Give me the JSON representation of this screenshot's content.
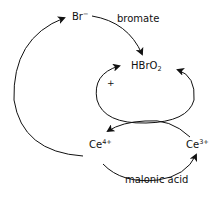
{
  "diagram": {
    "title": "",
    "nodes": {
      "bromide": {
        "base": "Br",
        "charge": "−"
      },
      "hbro2": {
        "base": "HBrO",
        "subscript": "2"
      },
      "ce4": {
        "base": "Ce",
        "charge": "4+"
      },
      "ce3": {
        "base": "Ce",
        "charge": "3+"
      }
    },
    "edge_labels": {
      "bromate": "bromate",
      "malonic_acid": "malonic acid",
      "autocatalysis": "+"
    },
    "edges": [
      {
        "from": "Br−",
        "to": "HBrO2",
        "label": "bromate"
      },
      {
        "from": "HBrO2",
        "to": "HBrO2",
        "label": "+",
        "type": "autocatalytic loop"
      },
      {
        "from": "Ce3+",
        "to": "Ce4+",
        "label": ""
      },
      {
        "from": "Ce4+",
        "to": "Br−",
        "label": ""
      },
      {
        "from": "Ce4+",
        "to": "Ce3+",
        "label": "malonic acid"
      }
    ],
    "colors": {
      "stroke": "#111111",
      "background": "#ffffff"
    }
  }
}
